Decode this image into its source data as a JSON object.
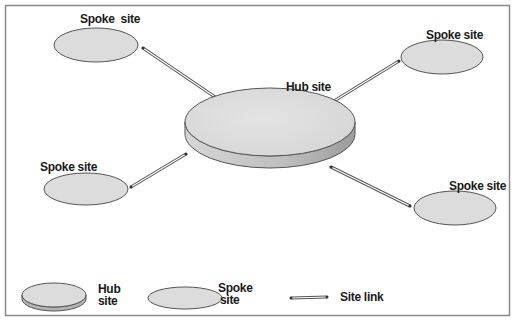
{
  "diagram": {
    "title": "",
    "type": "hub-and-spoke site topology",
    "colors": {
      "frame": "#8a8a8a",
      "node_fill": "#dcdcdc",
      "node_side": "#b4b4b4",
      "node_stroke": "#555555",
      "link": "#555555",
      "text": "#1a1a1a"
    },
    "nodes": [
      {
        "id": "hub",
        "label": "Hub site",
        "kind": "hub"
      },
      {
        "id": "spoke-top-left",
        "label": "Spoke  site",
        "kind": "spoke"
      },
      {
        "id": "spoke-top-right",
        "label": "Spoke site",
        "kind": "spoke"
      },
      {
        "id": "spoke-left",
        "label": "Spoke site",
        "kind": "spoke"
      },
      {
        "id": "spoke-right",
        "label": "Spoke site",
        "kind": "spoke"
      }
    ],
    "links": [
      {
        "from": "hub",
        "to": "spoke-top-left",
        "kind": "site-link"
      },
      {
        "from": "hub",
        "to": "spoke-top-right",
        "kind": "site-link"
      },
      {
        "from": "hub",
        "to": "spoke-left",
        "kind": "site-link"
      },
      {
        "from": "hub",
        "to": "spoke-right",
        "kind": "site-link"
      }
    ]
  },
  "legend": {
    "hub": {
      "line1": "Hub",
      "line2": "site"
    },
    "spoke": {
      "line1": "Spoke",
      "line2": "site"
    },
    "link": {
      "label": "Site link"
    }
  }
}
